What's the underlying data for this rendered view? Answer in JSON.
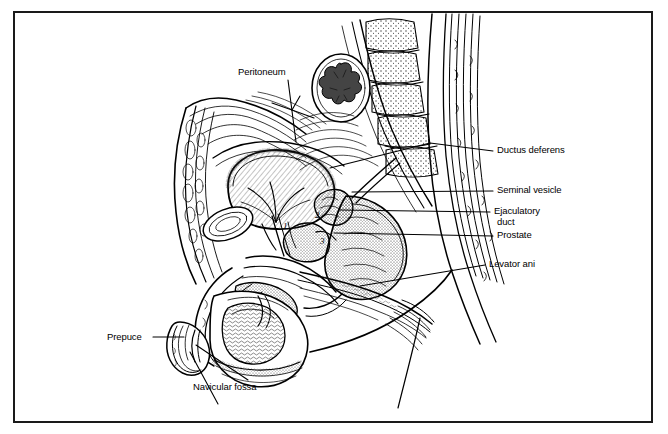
{
  "figure": {
    "kind": "anatomical-illustration",
    "style": "black-and-white line art with stipple and hatch shading",
    "border_color": "#1a1a1a",
    "background_color": "#ffffff",
    "ink_color": "#000000",
    "width": 668,
    "height": 434
  },
  "labels": [
    {
      "id": "peritoneum",
      "text": "Peritoneum",
      "side": "top",
      "x": 238,
      "y": 66
    },
    {
      "id": "ductus-deferens",
      "text": "Ductus deferens",
      "side": "right",
      "x": 497,
      "y": 148
    },
    {
      "id": "seminal-vesicle",
      "text": "Seminal vesicle",
      "side": "right",
      "x": 497,
      "y": 188
    },
    {
      "id": "ejaculatory-duct",
      "text": "Ejaculatory",
      "text2": "duct",
      "side": "right",
      "x": 494,
      "y": 209
    },
    {
      "id": "prostate",
      "text": "Prostate",
      "side": "right",
      "x": 497,
      "y": 233
    },
    {
      "id": "levator-ani",
      "text": "Levator ani",
      "side": "right",
      "x": 489,
      "y": 262
    },
    {
      "id": "prepuce",
      "text": "Prepuce",
      "side": "left",
      "x": 107,
      "y": 335
    },
    {
      "id": "navicular-fossa",
      "text": "Navicular fossa",
      "side": "left",
      "x": 193,
      "y": 385
    }
  ],
  "callout_numbers": [
    {
      "id": "callout-1",
      "text": "1",
      "x": 283,
      "y": 227
    },
    {
      "id": "callout-2",
      "text": "2",
      "x": 315,
      "y": 216
    },
    {
      "id": "callout-3",
      "text": "3",
      "x": 320,
      "y": 242
    }
  ]
}
